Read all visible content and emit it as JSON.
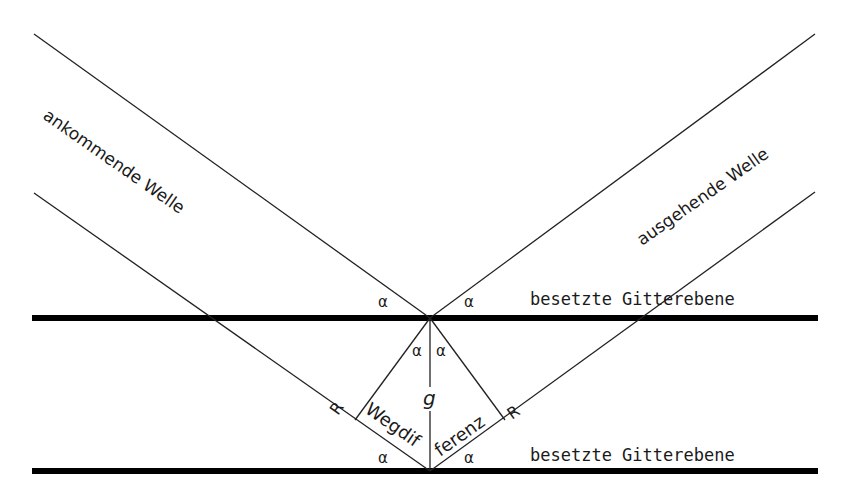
{
  "diagram": {
    "type": "Bragg reflection geometry",
    "labels": {
      "incoming_wave": "ankommende Welle",
      "outgoing_wave": "ausgehende Welle",
      "plane_upper": "besetzte Gitterebene",
      "plane_lower": "besetzte Gitterebene",
      "angle_symbol": "α",
      "spacing_symbol": "g",
      "right_angle_marker": "R",
      "path_difference_part1": "Wegdif",
      "path_difference_part2": "ferenz"
    },
    "colors": {
      "background": "#ffffff",
      "lines": "#000000",
      "text": "#1a1a1a"
    }
  }
}
